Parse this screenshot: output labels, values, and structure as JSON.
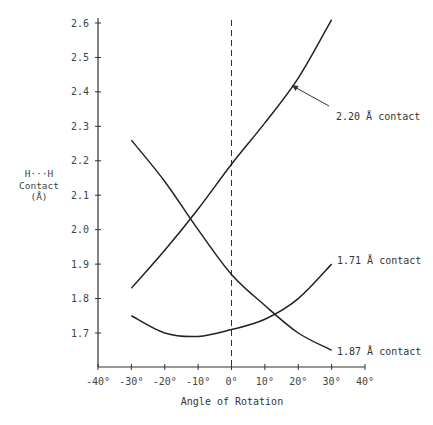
{
  "chart_data": {
    "type": "line",
    "title": "",
    "xlabel": "Angle of Rotation",
    "ylabel": "H···H Contact (Å)",
    "ylabel_lines": [
      "H···H",
      "Contact",
      "(Å)"
    ],
    "xlim": [
      -40,
      40
    ],
    "ylim": [
      1.6,
      2.6
    ],
    "x_ticks": [
      -40,
      -30,
      -20,
      -10,
      0,
      10,
      20,
      30,
      40
    ],
    "x_tick_labels": [
      "-40°",
      "-30°",
      "-20°",
      "-10°",
      "0°",
      "10°",
      "20°",
      "30°",
      "40°"
    ],
    "y_ticks": [
      1.7,
      1.8,
      1.9,
      2.0,
      2.1,
      2.2,
      2.3,
      2.4,
      2.5,
      2.6
    ],
    "y_tick_labels": [
      "1.7",
      "1.8",
      "1.9",
      "2.0",
      "2.1",
      "2.2",
      "2.3",
      "2.4",
      "2.5",
      "2.6"
    ],
    "grid": false,
    "legend": "none (curves labeled directly)",
    "x": [
      -30,
      -20,
      -10,
      0,
      10,
      20,
      30
    ],
    "series": [
      {
        "name": "2.20 Å contact",
        "values": [
          1.83,
          1.94,
          2.06,
          2.19,
          2.31,
          2.44,
          2.61
        ]
      },
      {
        "name": "1.87 Å contact",
        "values": [
          2.26,
          2.14,
          2.0,
          1.87,
          1.78,
          1.7,
          1.65
        ]
      },
      {
        "name": "1.71 Å contact",
        "values": [
          1.75,
          1.7,
          1.69,
          1.71,
          1.74,
          1.8,
          1.9
        ]
      }
    ],
    "annotations": [
      {
        "text": "2.20 Å contact",
        "arrow_to": [
          18,
          2.42
        ]
      },
      {
        "text": "1.71 Å contact",
        "attached_to": "end of 1.71 curve"
      },
      {
        "text": "1.87 Å contact",
        "attached_to": "end of 1.87 curve"
      }
    ],
    "reference_lines": [
      {
        "type": "vertical",
        "x": 0,
        "style": "dashed"
      }
    ]
  }
}
